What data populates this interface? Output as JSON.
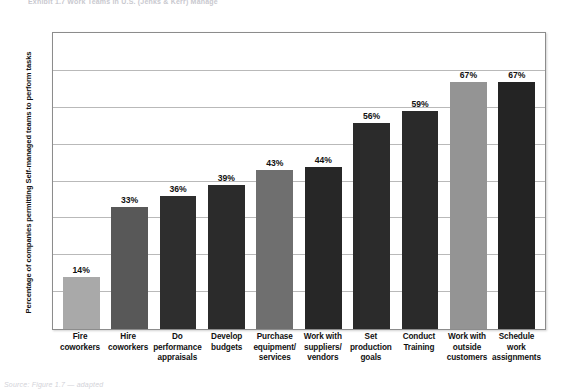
{
  "page": {
    "top_caption": "Exhibit 1.7   Work Teams in U.S. (Jenks & Kerr) Manage",
    "bottom_caption": "Source: Figure 1.7 — adapted"
  },
  "chart_data": {
    "type": "bar",
    "title": "",
    "xlabel": "",
    "ylabel": "Percentage of companies permitting Self-managed teams to perform tasks",
    "ylim": [
      0,
      80
    ],
    "grid": true,
    "gridline_values": [
      10,
      20,
      30,
      40,
      50,
      60,
      70
    ],
    "legend": "none",
    "categories": [
      "Fire coworkers",
      "Hire coworkers",
      "Do performance appraisals",
      "Develop budgets",
      "Purchase equipment/ services",
      "Work with suppliers/ vendors",
      "Set production goals",
      "Conduct Training",
      "Work with outside customers",
      "Schedule work assignments"
    ],
    "values": [
      14,
      33,
      36,
      39,
      43,
      44,
      56,
      59,
      67,
      67
    ],
    "value_labels": [
      "14%",
      "33%",
      "36%",
      "39%",
      "43%",
      "44%",
      "56%",
      "59%",
      "67%",
      "67%"
    ],
    "bar_colors": [
      "#a9a9a9",
      "#585858",
      "#2e2e2e",
      "#2b2b2b",
      "#6f6f6f",
      "#272727",
      "#2b2b2b",
      "#2a2a2a",
      "#949494",
      "#242424"
    ]
  },
  "colors": {
    "plot_border": "#8c8c8c",
    "gridline": "#b9b9b9",
    "text": "#111111",
    "background": "#ffffff"
  }
}
